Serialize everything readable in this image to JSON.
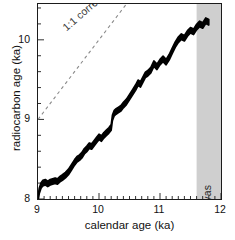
{
  "chart_data": {
    "type": "line",
    "title": "",
    "xlabel": "calendar age (ka)",
    "ylabel": "radiocarbon age (ka)",
    "xlim": [
      9,
      12
    ],
    "ylim": [
      8,
      10.45
    ],
    "xticks": [
      "9",
      "10",
      "11",
      "12"
    ],
    "xtick_values": [
      9,
      10,
      11,
      12
    ],
    "yticks": [
      "8",
      "9",
      "10"
    ],
    "ytick_values": [
      8,
      9,
      10
    ],
    "x_minor_step": 0.1,
    "y_minor_step": 0.2,
    "grid": false,
    "legend": "none",
    "annotations": [
      {
        "name": "one-to-one-line-label",
        "text": "1:1 correspondence",
        "type": "dashed-reference-line",
        "line_from": [
          9,
          9
        ],
        "line_to": [
          11.45,
          11.45
        ],
        "color": "#8a8a8a"
      },
      {
        "name": "younger-dryas-band",
        "text": "Younger Dryas",
        "type": "shaded-x-band",
        "x_from": 11.6,
        "x_to": 12,
        "color": "#cfcfcf"
      }
    ],
    "series": [
      {
        "name": "calibration-curve",
        "style": "filled-uncertainty-band",
        "color": "#000000",
        "band_half_width": 0.035,
        "x": [
          9.0,
          9.02,
          9.05,
          9.08,
          9.12,
          9.16,
          9.2,
          9.24,
          9.28,
          9.32,
          9.36,
          9.4,
          9.45,
          9.5,
          9.55,
          9.6,
          9.64,
          9.68,
          9.72,
          9.76,
          9.8,
          9.84,
          9.88,
          9.92,
          9.96,
          10.0,
          10.04,
          10.08,
          10.12,
          10.16,
          10.2,
          10.22,
          10.25,
          10.28,
          10.32,
          10.36,
          10.4,
          10.45,
          10.5,
          10.55,
          10.6,
          10.64,
          10.68,
          10.72,
          10.76,
          10.8,
          10.85,
          10.9,
          10.95,
          11.0,
          11.05,
          11.1,
          11.15,
          11.2,
          11.25,
          11.3,
          11.35,
          11.4,
          11.45,
          11.5,
          11.55,
          11.6,
          11.65,
          11.7,
          11.75,
          11.8
        ],
        "y": [
          8.0,
          8.1,
          8.17,
          8.2,
          8.21,
          8.19,
          8.21,
          8.22,
          8.23,
          8.22,
          8.25,
          8.27,
          8.3,
          8.34,
          8.4,
          8.46,
          8.5,
          8.52,
          8.55,
          8.6,
          8.63,
          8.67,
          8.66,
          8.7,
          8.74,
          8.78,
          8.76,
          8.8,
          8.83,
          8.86,
          8.9,
          9.02,
          9.08,
          9.1,
          9.12,
          9.14,
          9.18,
          9.22,
          9.28,
          9.34,
          9.4,
          9.46,
          9.44,
          9.5,
          9.56,
          9.58,
          9.62,
          9.7,
          9.66,
          9.72,
          9.76,
          9.72,
          9.78,
          9.86,
          9.94,
          10.0,
          10.04,
          10.02,
          10.08,
          10.12,
          10.1,
          10.16,
          10.2,
          10.18,
          10.24,
          10.22
        ]
      }
    ]
  },
  "axis": {
    "x_title": "calendar age (ka)",
    "y_title": "radiocarbon age (ka)"
  },
  "labels": {
    "correspondence": "1:1 correspondence",
    "younger_dryas": "Younger Dryas"
  },
  "colors": {
    "curve": "#000000",
    "band": "#cfcfcf",
    "reference_line": "#8a8a8a",
    "frame": "#1b1b1b"
  }
}
